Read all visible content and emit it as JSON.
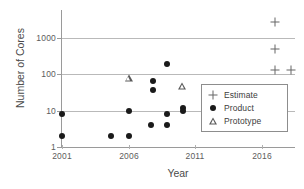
{
  "chart_data": {
    "type": "scatter",
    "title": "",
    "xlabel": "Year",
    "ylabel": "Number of Cores",
    "xlim": [
      2000,
      2018
    ],
    "ylim": [
      1,
      3000
    ],
    "yscale": "log",
    "grid": "horizontal",
    "legend_position": "center-right",
    "xticks": [
      "2001",
      "2006",
      "2011",
      "2016"
    ],
    "xtick_values": [
      2001,
      2006,
      2011,
      2016
    ],
    "yticks": [
      "1",
      "10",
      "100",
      "1000"
    ],
    "ytick_values": [
      1,
      10,
      100,
      1000
    ],
    "series": [
      {
        "name": "Estimate",
        "marker": "plus",
        "color": "#666666",
        "points": [
          {
            "x": 2017.0,
            "y": 2800
          },
          {
            "x": 2017.0,
            "y": 480
          },
          {
            "x": 2017.0,
            "y": 130
          },
          {
            "x": 2018.2,
            "y": 130
          }
        ]
      },
      {
        "name": "Product",
        "marker": "filled-circle",
        "color": "#1a1a1a",
        "points": [
          {
            "x": 2001.0,
            "y": 8
          },
          {
            "x": 2001.0,
            "y": 2
          },
          {
            "x": 2004.7,
            "y": 2
          },
          {
            "x": 2006.0,
            "y": 10
          },
          {
            "x": 2006.0,
            "y": 2
          },
          {
            "x": 2007.8,
            "y": 65
          },
          {
            "x": 2007.8,
            "y": 38
          },
          {
            "x": 2007.7,
            "y": 4
          },
          {
            "x": 2008.9,
            "y": 190
          },
          {
            "x": 2008.9,
            "y": 8
          },
          {
            "x": 2008.9,
            "y": 4
          },
          {
            "x": 2010.1,
            "y": 12
          },
          {
            "x": 2010.1,
            "y": 10
          }
        ]
      },
      {
        "name": "Prototype",
        "marker": "open-triangle",
        "color": "#5a5a5a",
        "points": [
          {
            "x": 2006.0,
            "y": 80
          },
          {
            "x": 2010.0,
            "y": 48
          }
        ]
      }
    ]
  },
  "legend": {
    "items": [
      {
        "label": "Estimate",
        "glyph": "plus-icon"
      },
      {
        "label": "Product",
        "glyph": "filled-circle-icon"
      },
      {
        "label": "Prototype",
        "glyph": "open-triangle-icon"
      }
    ]
  },
  "colors": {
    "axis": "#9a9a9a",
    "grid": "#b9b9b9",
    "text": "#4a4a4a",
    "product": "#1a1a1a",
    "prototype": "#5a5a5a",
    "estimate": "#666666"
  }
}
